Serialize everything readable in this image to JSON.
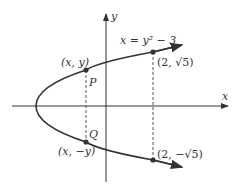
{
  "diagram": {
    "equation_label": "x = y² − 3",
    "axes": {
      "x_label": "x",
      "y_label": "y"
    },
    "points": [
      {
        "name": "P",
        "coord_label": "(x, y)"
      },
      {
        "name": "Q",
        "coord_label": "(x, −y)"
      },
      {
        "name": "upper-endpoint",
        "coord_label": "(2, √5)"
      },
      {
        "name": "lower-endpoint",
        "coord_label": "(2, −√5)"
      }
    ],
    "colors": {
      "curve": "#333333",
      "axes": "#333333",
      "dashed": "#555555",
      "point": "#333333"
    }
  }
}
